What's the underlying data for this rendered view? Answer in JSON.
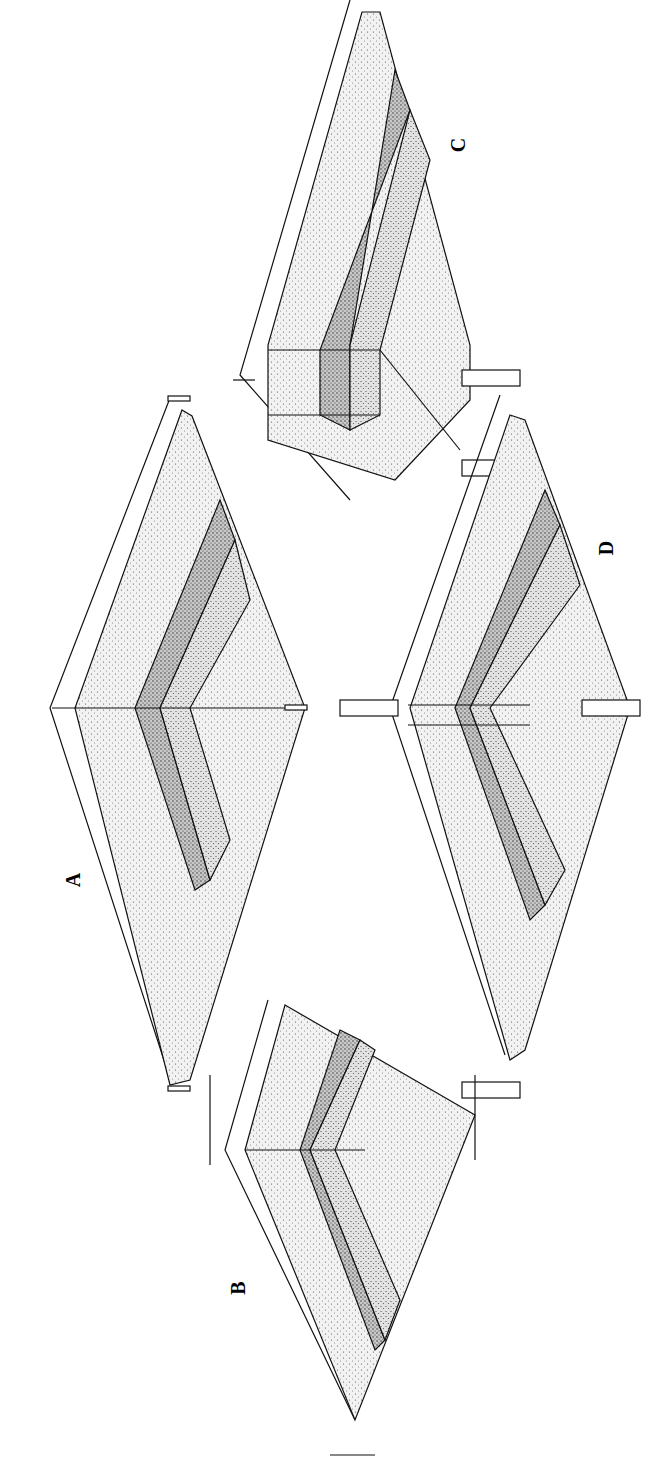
{
  "figure": {
    "panels": [
      {
        "id": "A",
        "label": "A",
        "x": 80,
        "y": 880
      },
      {
        "id": "B",
        "label": "B",
        "x": 245,
        "y": 1288
      },
      {
        "id": "C",
        "label": "C",
        "x": 465,
        "y": 145
      },
      {
        "id": "D",
        "label": "D",
        "x": 613,
        "y": 548
      }
    ],
    "colors": {
      "line": "#111111",
      "light_fill": "#e9e9e9",
      "mid_fill": "#d2d2d2",
      "dark_fill": "#a9a9a9",
      "background": "#ffffff"
    }
  }
}
